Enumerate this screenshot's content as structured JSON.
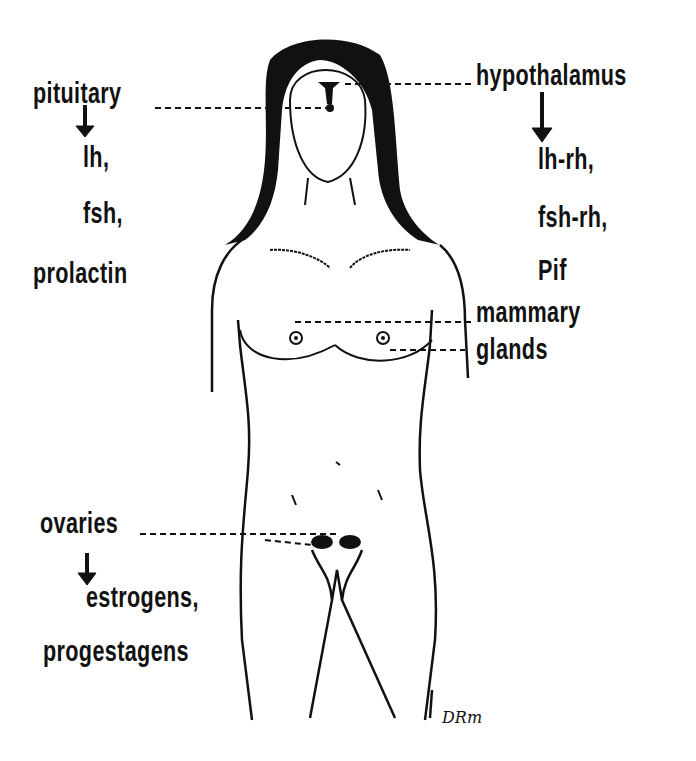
{
  "diagram": {
    "labels": {
      "pituitary": {
        "name": "pituitary",
        "products": [
          "lh,",
          "fsh,",
          "prolactin"
        ]
      },
      "hypothalamus": {
        "name": "hypothalamus",
        "products": [
          "lh-rh,",
          "fsh-rh,",
          "Pif"
        ]
      },
      "mammary": {
        "line1": "mammary",
        "line2": "glands"
      },
      "ovaries": {
        "name": "ovaries",
        "products": [
          "estrogens,",
          "progestagens"
        ]
      }
    },
    "signature": "DRm",
    "colors": {
      "ink": "#111111",
      "background": "#ffffff"
    }
  }
}
